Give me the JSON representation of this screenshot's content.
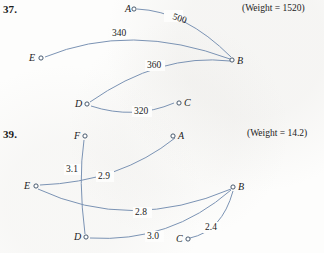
{
  "page": {
    "width": 324,
    "height": 253,
    "edge_color": "#7b93b4",
    "node_stroke_color": "#33475f",
    "text_color": "#1b1b1b"
  },
  "problems": [
    {
      "number": "37.",
      "number_pos": {
        "x": 3,
        "y": 3
      },
      "weight_note": "(Weight = 1520)",
      "weight_note_pos": {
        "x": 242,
        "y": 3
      },
      "nodes": [
        {
          "id": "A",
          "label": "A",
          "x": 131,
          "y": 9,
          "label_dx": -9,
          "label_dy": 3
        },
        {
          "id": "B",
          "label": "B",
          "x": 232,
          "y": 60,
          "label_dx": 5,
          "label_dy": 4
        },
        {
          "id": "C",
          "label": "C",
          "x": 179,
          "y": 103,
          "label_dx": 5,
          "label_dy": 3
        },
        {
          "id": "D",
          "label": "D",
          "x": 85,
          "y": 104,
          "label_dx": -11,
          "label_dy": 3
        },
        {
          "id": "E",
          "label": "E",
          "x": 39,
          "y": 58,
          "label_dx": -11,
          "label_dy": 3
        }
      ],
      "edges": [
        {
          "from": "A",
          "to": "B",
          "weight": "500",
          "label_x": 172,
          "label_y": 19
        },
        {
          "from": "E",
          "to": "B",
          "weight": "340",
          "label_x": 112,
          "label_y": 36
        },
        {
          "from": "D",
          "to": "B",
          "weight": "360",
          "label_x": 147,
          "label_y": 68
        },
        {
          "from": "D",
          "to": "C",
          "weight": "320",
          "label_x": 134,
          "label_y": 114
        }
      ]
    },
    {
      "number": "39.",
      "number_pos": {
        "x": 3,
        "y": 128
      },
      "weight_note": "(Weight = 14.2)",
      "weight_note_pos": {
        "x": 247,
        "y": 128
      },
      "nodes": [
        {
          "id": "F",
          "label": "F",
          "x": 85,
          "y": 136,
          "label_dx": -10,
          "label_dy": 3
        },
        {
          "id": "A",
          "label": "A",
          "x": 178,
          "y": 136,
          "label_dx": 5,
          "label_dy": 3
        },
        {
          "id": "E",
          "label": "E",
          "x": 34,
          "y": 186,
          "label_dx": -11,
          "label_dy": 3
        },
        {
          "id": "B",
          "label": "B",
          "x": 233,
          "y": 187,
          "label_dx": 5,
          "label_dy": 3
        },
        {
          "id": "D",
          "label": "D",
          "x": 84,
          "y": 237,
          "label_dx": -11,
          "label_dy": 3
        },
        {
          "id": "C",
          "label": "C",
          "x": 186,
          "y": 239,
          "label_dx": -11,
          "label_dy": 3
        }
      ],
      "edges": [
        {
          "from": "F",
          "to": "D",
          "weight": "3.1",
          "label_x": 66,
          "label_y": 172
        },
        {
          "from": "E",
          "to": "A",
          "weight": "2.9",
          "label_x": 98,
          "label_y": 179
        },
        {
          "from": "E",
          "to": "B",
          "weight": "2.8",
          "label_x": 135,
          "label_y": 215
        },
        {
          "from": "D",
          "to": "B",
          "weight": "3.0",
          "label_x": 147,
          "label_y": 239
        },
        {
          "from": "C",
          "to": "B",
          "weight": "2.4",
          "label_x": 205,
          "label_y": 230
        }
      ]
    }
  ],
  "graph_data": {
    "type": "diagram",
    "description": "Two weighted graph exercise figures from a discrete mathematics textbook showing Hamilton-circuit / tree edge selections",
    "figures": [
      {
        "label": "37.",
        "total_weight": 1520,
        "vertices": [
          "A",
          "B",
          "C",
          "D",
          "E"
        ],
        "edges": [
          {
            "u": "A",
            "v": "B",
            "w": 500
          },
          {
            "u": "E",
            "v": "B",
            "w": 340
          },
          {
            "u": "D",
            "v": "B",
            "w": 360
          },
          {
            "u": "D",
            "v": "C",
            "w": 320
          }
        ]
      },
      {
        "label": "39.",
        "total_weight": 14.2,
        "vertices": [
          "A",
          "B",
          "C",
          "D",
          "E",
          "F"
        ],
        "edges": [
          {
            "u": "F",
            "v": "D",
            "w": 3.1
          },
          {
            "u": "E",
            "v": "A",
            "w": 2.9
          },
          {
            "u": "E",
            "v": "B",
            "w": 2.8
          },
          {
            "u": "D",
            "v": "B",
            "w": 3.0
          },
          {
            "u": "C",
            "v": "B",
            "w": 2.4
          }
        ]
      }
    ]
  }
}
